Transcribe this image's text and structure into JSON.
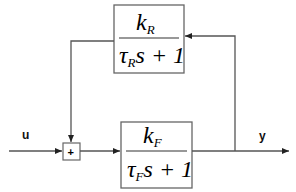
{
  "diagram": {
    "type": "block-diagram",
    "input_label": "u",
    "output_label": "y",
    "summer": {
      "symbol": "+"
    },
    "forward_block": {
      "numerator": {
        "base": "k",
        "subscript": "F"
      },
      "denominator": {
        "tau": "τ",
        "subscript": "F",
        "rest": "s + 1"
      }
    },
    "feedback_block": {
      "numerator": {
        "base": "k",
        "subscript": "R"
      },
      "denominator": {
        "tau": "τ",
        "subscript": "R",
        "rest": "s + 1"
      }
    },
    "colors": {
      "line": "#555555",
      "box": "#666666",
      "text": "#000000"
    }
  }
}
